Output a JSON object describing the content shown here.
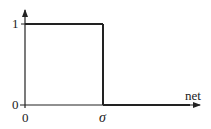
{
  "diagram": {
    "type": "step-function",
    "colors": {
      "line": "#222222",
      "background": "#ffffff"
    },
    "y_axis": {
      "tick_labels": [
        "1",
        "0"
      ]
    },
    "x_axis": {
      "label": "net",
      "tick_labels": [
        "0",
        "σ"
      ]
    },
    "function": {
      "description": "Output is 1 for net below σ and drops to 0 at net = σ",
      "segments": [
        {
          "from": "0",
          "to": "σ",
          "value": 1
        },
        {
          "from": "σ",
          "to": "∞",
          "value": 0
        }
      ]
    }
  }
}
